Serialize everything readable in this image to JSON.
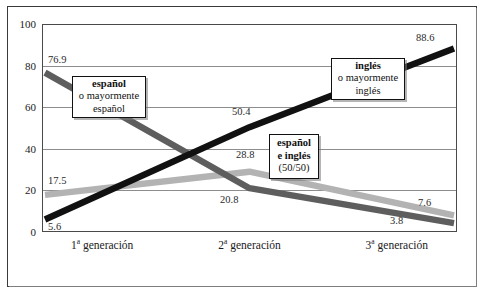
{
  "chart_data": {
    "type": "line",
    "title": "",
    "xlabel": "",
    "ylabel": "",
    "categories": [
      "1ª generación",
      "2ª generación",
      "3ª generación"
    ],
    "ylim": [
      0,
      100
    ],
    "yticks": [
      0,
      20,
      40,
      60,
      80,
      100
    ],
    "grid": true,
    "legend_position": "inline-callouts",
    "series": [
      {
        "name": "español o mayormente español",
        "color": "#5e5e5e",
        "values": [
          76.9,
          20.8,
          3.8
        ],
        "labels": [
          "76.9",
          "20.8",
          "3.8"
        ]
      },
      {
        "name": "inglés o mayormente inglés",
        "color": "#111111",
        "values": [
          5.6,
          50.4,
          88.6
        ],
        "labels": [
          "5.6",
          "50.4",
          "88.6"
        ]
      },
      {
        "name": "español e inglés (50/50)",
        "color": "#b3b3b3",
        "values": [
          17.5,
          28.8,
          7.6
        ],
        "labels": [
          "17.5",
          "28.8",
          "7.6"
        ]
      }
    ]
  },
  "axes": {
    "y_ticks": [
      "100",
      "80",
      "60",
      "40",
      "20",
      "0"
    ],
    "x_ticks": [
      {
        "num": "1",
        "ord": "a",
        "rest": " generación"
      },
      {
        "num": "2",
        "ord": "a",
        "rest": " generación"
      },
      {
        "num": "3",
        "ord": "a",
        "rest": " generación"
      }
    ]
  },
  "value_labels": {
    "sp_g1": "76.9",
    "sp_g2": "20.8",
    "sp_g3": "3.8",
    "en_g1": "5.6",
    "en_g2": "50.4",
    "en_g3": "88.6",
    "mix_g1": "17.5",
    "mix_g2": "28.8",
    "mix_g3": "7.6"
  },
  "callouts": {
    "spanish": {
      "line1": "español",
      "line2": "o mayormente",
      "line3": "español"
    },
    "english": {
      "line1": "inglés",
      "line2": "o mayormente",
      "line3": "inglés"
    },
    "mixed": {
      "line1": "español",
      "line2": "e inglés",
      "line3": "(50/50)"
    }
  },
  "colors": {
    "spanish_line": "#5e5e5e",
    "english_line": "#111111",
    "mixed_line": "#b3b3b3",
    "grid": "#8d8d8d",
    "frame": "#3a3a3a",
    "background": "#ffffff"
  }
}
